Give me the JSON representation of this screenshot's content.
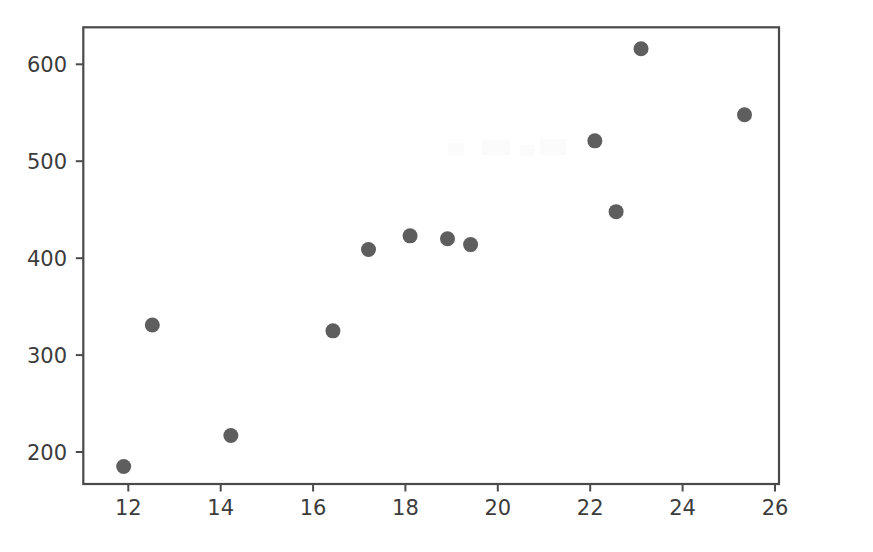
{
  "figure": {
    "title": "",
    "background_color": "#ffffff",
    "width": 873,
    "height": 552
  },
  "axes": {
    "frame_color": "#4a4a4a",
    "x_tick_labels": [
      "12",
      "14",
      "16",
      "18",
      "20",
      "22",
      "24",
      "26"
    ],
    "y_tick_labels": [
      "200",
      "300",
      "400",
      "500",
      "600"
    ],
    "xlabel": "",
    "ylabel": ""
  },
  "chart_data": {
    "type": "scatter",
    "title": "",
    "xlabel": "",
    "ylabel": "",
    "xlim": [
      11.3,
      26.05
    ],
    "ylim": [
      164,
      635
    ],
    "xticks": [
      12,
      14,
      16,
      18,
      20,
      22,
      24,
      26
    ],
    "yticks": [
      200,
      300,
      400,
      500,
      600
    ],
    "grid": false,
    "legend": null,
    "marker": {
      "shape": "circle",
      "color": "#5e5e5e",
      "size_px": 15,
      "alpha": 1.0
    },
    "series": [
      {
        "name": "series-1",
        "color": "#5e5e5e",
        "points": [
          {
            "x": 11.9,
            "y": 185
          },
          {
            "x": 12.52,
            "y": 331
          },
          {
            "x": 14.22,
            "y": 217
          },
          {
            "x": 16.43,
            "y": 325
          },
          {
            "x": 17.2,
            "y": 409
          },
          {
            "x": 18.1,
            "y": 423
          },
          {
            "x": 18.91,
            "y": 420
          },
          {
            "x": 19.41,
            "y": 414
          },
          {
            "x": 22.1,
            "y": 521
          },
          {
            "x": 22.56,
            "y": 448
          },
          {
            "x": 23.1,
            "y": 616
          },
          {
            "x": 25.34,
            "y": 548
          }
        ]
      }
    ],
    "x": [
      11.9,
      12.52,
      14.22,
      16.43,
      17.2,
      18.1,
      18.91,
      19.41,
      22.1,
      22.56,
      23.1,
      25.34
    ],
    "y": [
      185,
      331,
      217,
      325,
      409,
      423,
      420,
      414,
      521,
      448,
      616,
      548
    ]
  }
}
